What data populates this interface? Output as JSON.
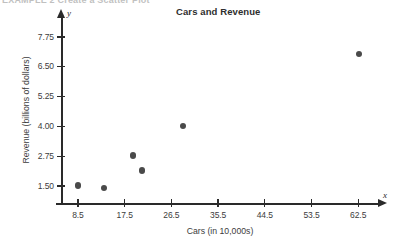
{
  "page_header": {
    "text": "EXAMPLE 2   Create a Scatter Plot"
  },
  "chart_data": {
    "type": "scatter",
    "title": "Cars and Revenue",
    "xlabel": "Cars (in 10,000s)",
    "ylabel": "Revenue (billions of dollars)",
    "x_axis_name": "x",
    "y_axis_name": "y",
    "xlim": [
      4.0,
      67.0
    ],
    "ylim": [
      0.875,
      8.375
    ],
    "xticks": [
      8.5,
      17.5,
      26.5,
      35.5,
      44.5,
      53.5,
      62.5
    ],
    "xtick_labels": [
      "8.5",
      "17.5",
      "26.5",
      "35.5",
      "44.5",
      "53.5",
      "62.5"
    ],
    "yticks": [
      1.5,
      2.75,
      4.0,
      5.25,
      6.5,
      7.75
    ],
    "ytick_labels": [
      "1.50",
      "2.75",
      "4.00",
      "5.25",
      "6.50",
      "7.75"
    ],
    "grid": false,
    "legend": false,
    "marker": "filled-circle",
    "marker_color": "#4a4a4a",
    "axis_color": "#2a2a2a",
    "points": [
      {
        "x": 8.5,
        "y": 1.52
      },
      {
        "x": 13.5,
        "y": 1.4
      },
      {
        "x": 19.1,
        "y": 2.78
      },
      {
        "x": 20.8,
        "y": 2.15
      },
      {
        "x": 28.7,
        "y": 4.0
      },
      {
        "x": 62.6,
        "y": 7.05
      }
    ]
  }
}
